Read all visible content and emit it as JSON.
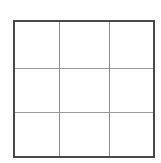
{
  "page": {
    "background_color": "#ffffff",
    "width": 161,
    "height": 163
  },
  "grid": {
    "name": "empty-3x3-grid",
    "rows": 3,
    "columns": 3,
    "outer_border_color": "#4a4a4a",
    "outer_border_width_px": 2,
    "inner_line_color_vertical": "#8c8c8c",
    "inner_line_color_horizontal": "#9a9a9a",
    "inner_line_width_px": 1,
    "cell_background_color": "#ffffff",
    "cells": [
      [
        "",
        "",
        ""
      ],
      [
        "",
        "",
        ""
      ],
      [
        "",
        "",
        ""
      ]
    ]
  }
}
